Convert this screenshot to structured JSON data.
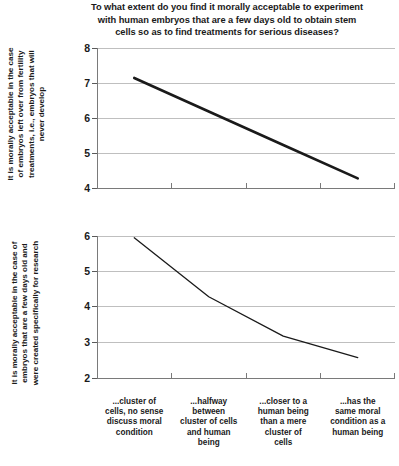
{
  "title": "To what extent do you find it morally acceptable to experiment with human embryos that are a few days old to obtain stem cells so as to find treatments for serious diseases?",
  "title_lines": [
    "To what extent do you find it morally acceptable to experiment",
    "with human embryos that are a few days old to obtain stem",
    "cells so as to find treatments for serious diseases?"
  ],
  "categories": [
    "...cluster of cells, no sense discuss moral condition",
    "...halfway between cluster of cells and human being",
    "...closer to a human being than a mere cluster of cells",
    "...has the same moral condition as a human being"
  ],
  "category_lines": [
    [
      "...cluster of",
      "cells, no sense",
      "discuss moral",
      "condition"
    ],
    [
      "...halfway",
      "between",
      "cluster of cells",
      "and human",
      "being"
    ],
    [
      "...closer to a",
      "human being",
      "than a mere",
      "cluster of",
      "cells"
    ],
    [
      "...has the",
      "same moral",
      "condition as a",
      "human being"
    ]
  ],
  "chart_data": [
    {
      "type": "line",
      "title": "To what extent do you find it morally acceptable to experiment with human embryos that are a few days old to obtain stem cells so as to find treatments for serious diseases?",
      "ylabel": "It is morally acceptable in the case of embryos left over from fertility treatments, i.e., embryos that will never develop",
      "ylabel_lines": [
        "It is morally acceptable in the case",
        "of embryos left over from fertility",
        "treatments, i.e., embryos that will",
        "never develop"
      ],
      "xlabel": "",
      "categories": [
        "...cluster of cells, no sense discuss moral condition",
        "...halfway between cluster of cells and human being",
        "...closer to a human being than a mere cluster of cells",
        "...has the same moral condition as a human being"
      ],
      "values": [
        7.15,
        6.2,
        5.25,
        4.3
      ],
      "ylim": [
        4,
        8
      ],
      "yticks": [
        "4",
        "5",
        "6",
        "7",
        "8"
      ],
      "grid": true,
      "legend": "none",
      "line_color": "#1a1a1a",
      "line_width": 2.6
    },
    {
      "type": "line",
      "title": "",
      "ylabel": "It is morally acceptable in the case of embryos that are a few days old and were created specifically for research",
      "ylabel_lines": [
        "It is morally acceptable in the case of",
        "embryos that are a few days old and",
        "were created specifically for research"
      ],
      "xlabel": "",
      "categories": [
        "...cluster of cells, no sense discuss moral condition",
        "...halfway between cluster of cells and human being",
        "...closer to a human being than a mere cluster of cells",
        "...has the same moral condition as a human being"
      ],
      "values": [
        5.95,
        4.3,
        3.2,
        2.6
      ],
      "ylim": [
        2,
        6
      ],
      "yticks": [
        "2",
        "3",
        "4",
        "5",
        "6"
      ],
      "grid": true,
      "legend": "none",
      "line_color": "#1a1a1a",
      "line_width": 1.3
    }
  ],
  "colors": {
    "background": "#ffffff",
    "text": "#1a1a1a",
    "gridline": "#bfbfbf",
    "axis": "#7a7a7a",
    "series": "#1a1a1a"
  }
}
